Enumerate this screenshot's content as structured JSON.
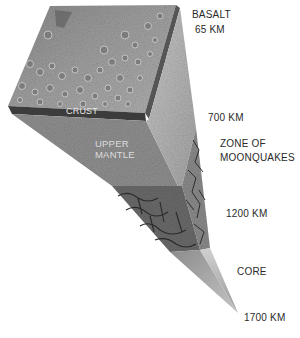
{
  "diagram": {
    "layers_inside": {
      "crust": "CRUST",
      "upper_mantle_line1": "UPPER",
      "upper_mantle_line2": "MANTLE"
    },
    "labels": {
      "basalt": "BASALT",
      "basalt_depth": "65 KM",
      "depth_700": "700 KM",
      "moonquakes_line1": "ZONE OF",
      "moonquakes_line2": "MOONQUAKES",
      "depth_1200": "1200 KM",
      "core": "CORE",
      "depth_1700": "1700 KM"
    },
    "colors": {
      "surface": "#9a9a9a",
      "crust_band": "#3c3c3c",
      "upper_mantle": "#8f8f8f",
      "right_face": "#b9b9b9",
      "lower_mantle": "#6a6a6a",
      "core": "#a8a8a8",
      "text": "#2a2a2a"
    }
  }
}
